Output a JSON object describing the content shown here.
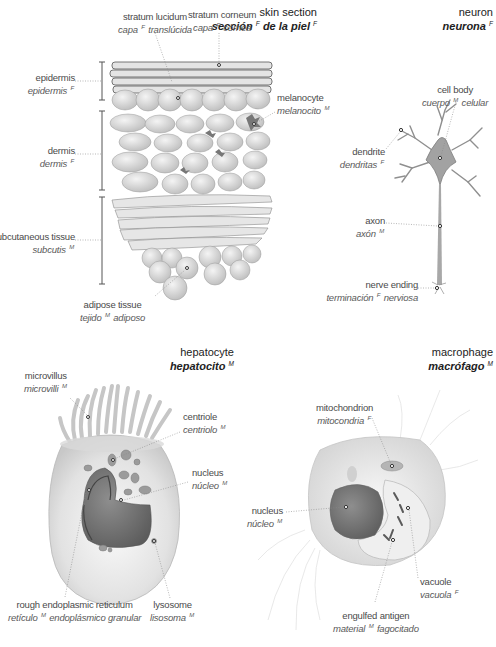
{
  "sections": {
    "skin": {
      "title_en": "skin section",
      "title_es_1": "sección",
      "title_es_g1": "F",
      "title_es_2": "de la piel",
      "title_es_g2": "F",
      "labels": {
        "stratum_lucidum": {
          "en": "stratum lucidum",
          "es_1": "capa",
          "gender": "F",
          "es_2": "translúcida"
        },
        "stratum_corneum": {
          "en": "stratum corneum",
          "es_1": "capa",
          "gender": "F",
          "es_2": "córnea"
        },
        "epidermis": {
          "en": "epidermis",
          "es_1": "epidermis",
          "gender": "F",
          "es_2": ""
        },
        "melanocyte": {
          "en": "melanocyte",
          "es_1": "melanocito",
          "gender": "M",
          "es_2": ""
        },
        "dermis": {
          "en": "dermis",
          "es_1": "dermis",
          "gender": "F",
          "es_2": ""
        },
        "subcutaneous": {
          "en": "subcutaneous tissue",
          "es_1": "subcutis",
          "gender": "M",
          "es_2": ""
        },
        "adipose": {
          "en": "adipose tissue",
          "es_1": "tejido",
          "gender": "M",
          "es_2": "adiposo"
        }
      }
    },
    "neuron": {
      "title_en": "neuron",
      "title_es": "neurona",
      "title_gender": "F",
      "labels": {
        "cell_body": {
          "en": "cell body",
          "es_1": "cuerpo",
          "gender": "M",
          "es_2": "celular"
        },
        "dendrite": {
          "en": "dendrite",
          "es_1": "dendritas",
          "gender": "F",
          "es_2": ""
        },
        "axon": {
          "en": "axon",
          "es_1": "axón",
          "gender": "M",
          "es_2": ""
        },
        "nerve_ending": {
          "en": "nerve ending",
          "es_1": "terminación",
          "gender": "F",
          "es_2": "nerviosa"
        }
      }
    },
    "hepatocyte": {
      "title_en": "hepatocyte",
      "title_es": "hepatocito",
      "title_gender": "M",
      "labels": {
        "microvillus": {
          "en": "microvillus",
          "es_1": "microvilli",
          "gender": "M",
          "es_2": ""
        },
        "centriole": {
          "en": "centriole",
          "es_1": "centriolo",
          "gender": "M",
          "es_2": ""
        },
        "nucleus": {
          "en": "nucleus",
          "es_1": "núcleo",
          "gender": "M",
          "es_2": ""
        },
        "rer": {
          "en": "rough endoplasmic reticulum",
          "es_1": "retículo",
          "gender": "M",
          "es_2": "endoplásmico granular"
        },
        "lysosome": {
          "en": "lysosome",
          "es_1": "lisosoma",
          "gender": "M",
          "es_2": ""
        }
      }
    },
    "macrophage": {
      "title_en": "macrophage",
      "title_es": "macrófago",
      "title_gender": "M",
      "labels": {
        "mitochondrion": {
          "en": "mitochondrion",
          "es_1": "mitocondria",
          "gender": "F",
          "es_2": ""
        },
        "nucleus": {
          "en": "nucleus",
          "es_1": "núcleo",
          "gender": "M",
          "es_2": ""
        },
        "vacuole": {
          "en": "vacuole",
          "es_1": "vacuola",
          "gender": "F",
          "es_2": ""
        },
        "antigen": {
          "en": "engulfed antigen",
          "es_1": "material",
          "gender": "M",
          "es_2": "fagocitado"
        }
      }
    }
  }
}
